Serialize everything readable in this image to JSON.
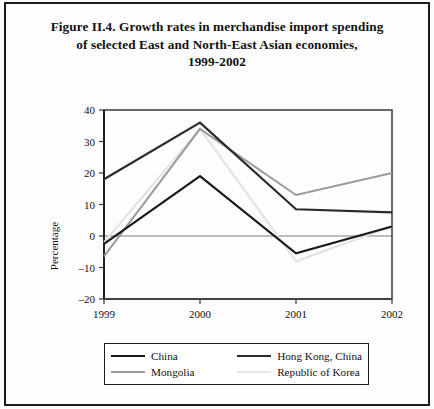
{
  "figure": {
    "title_lines": [
      "Figure II.4.  Growth rates in merchandise import spending",
      "of selected East and North-East Asian economies,",
      "1999-2002"
    ]
  },
  "chart_data": {
    "type": "line",
    "title": "Figure II.4.  Growth rates in merchandise import spending of selected East and North-East Asian economies, 1999-2002",
    "xlabel": "",
    "ylabel": "Percentage",
    "x": [
      "1999",
      "2000",
      "2001",
      "2002"
    ],
    "categories": [
      "1999",
      "2000",
      "2001",
      "2002"
    ],
    "xtick_labels": [
      "1999",
      "2000",
      "2001",
      "2002"
    ],
    "ytick_labels": [
      "40",
      "30",
      "20",
      "10",
      "0",
      "-10",
      "-20"
    ],
    "yticks": [
      40,
      30,
      20,
      10,
      0,
      -10,
      -20
    ],
    "ylim": [
      -20,
      40
    ],
    "grid": false,
    "zero_line": true,
    "legend_position": "bottom",
    "series": [
      {
        "name": "China",
        "values": [
          -2.5,
          19,
          -5.5,
          3
        ],
        "color": "#1a1a1a",
        "width": 2.2
      },
      {
        "name": "Hong Kong, China",
        "values": [
          18,
          36,
          8.5,
          7.5
        ],
        "color": "#2b2b2b",
        "width": 2.2
      },
      {
        "name": "Mongolia",
        "values": [
          -6.5,
          34,
          13,
          20
        ],
        "color": "#9a9a9a",
        "width": 2.0
      },
      {
        "name": "Republic of Korea",
        "values": [
          -2,
          34,
          -8,
          3
        ],
        "color": "#e2e2e2",
        "width": 2.0
      }
    ]
  },
  "legend": {
    "items": [
      {
        "label": "China",
        "color": "#1a1a1a",
        "width": 2.4
      },
      {
        "label": "Hong Kong, China",
        "color": "#2b2b2b",
        "width": 2.4
      },
      {
        "label": "Mongolia",
        "color": "#9a9a9a",
        "width": 2.0
      },
      {
        "label": "Republic of Korea",
        "color": "#e6e6e6",
        "width": 2.0
      }
    ]
  },
  "axis": {
    "y_title": "Percentage",
    "frame_color": "#3a3a3a",
    "zero_line_color": "#a6a6a6"
  }
}
